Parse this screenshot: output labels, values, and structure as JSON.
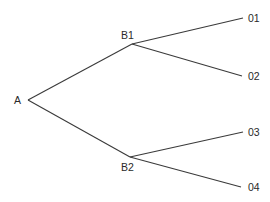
{
  "diagram": {
    "type": "tree",
    "nodes": [
      {
        "id": "A",
        "label": "A",
        "x": 28,
        "y": 100,
        "lx": 14,
        "ly": 104
      },
      {
        "id": "B1",
        "label": "B1",
        "x": 132,
        "y": 44,
        "lx": 121,
        "ly": 39
      },
      {
        "id": "B2",
        "label": "B2",
        "x": 130,
        "y": 157,
        "lx": 121,
        "ly": 171
      },
      {
        "id": "01",
        "label": "01",
        "x": 243,
        "y": 18,
        "lx": 248,
        "ly": 22
      },
      {
        "id": "02",
        "label": "02",
        "x": 242,
        "y": 76,
        "lx": 248,
        "ly": 80
      },
      {
        "id": "03",
        "label": "03",
        "x": 243,
        "y": 132,
        "lx": 248,
        "ly": 136
      },
      {
        "id": "04",
        "label": "04",
        "x": 241,
        "y": 187,
        "lx": 248,
        "ly": 191
      }
    ],
    "edges": [
      {
        "from": "A",
        "to": "B1"
      },
      {
        "from": "A",
        "to": "B2"
      },
      {
        "from": "B1",
        "to": "01"
      },
      {
        "from": "B1",
        "to": "02"
      },
      {
        "from": "B2",
        "to": "03"
      },
      {
        "from": "B2",
        "to": "04"
      }
    ]
  }
}
